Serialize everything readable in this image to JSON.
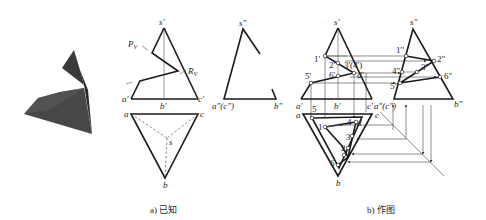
{
  "figure": {
    "iso_view": {
      "description": "shaded 3D sketch of cut triangular pyramid",
      "colors": {
        "dark": "#2b2b2b",
        "mid": "#4a4a4a",
        "light": "#6a6a6a"
      }
    },
    "part_a": {
      "caption": "a) 已知",
      "front_view": {
        "labels": {
          "apex": "s'",
          "a": "a'",
          "b": "b'",
          "c": "c'",
          "plane_p": "P",
          "plane_p_sub": "V",
          "plane_r": "R",
          "plane_r_sub": "V"
        }
      },
      "side_view": {
        "labels": {
          "apex": "s\"",
          "ac": "a\"(c\")",
          "b": "b\""
        }
      },
      "top_view": {
        "labels": {
          "a": "a",
          "b": "b",
          "c": "c",
          "s": "s"
        }
      }
    },
    "part_b": {
      "caption": "b) 作图",
      "front_view": {
        "labels": {
          "apex": "s'",
          "p1": "1'",
          "p2": "2'",
          "p34": "3'(4')",
          "p6": "6'",
          "p5": "5'",
          "d": "d'",
          "a": "a'",
          "b": "b'",
          "c": "c'"
        }
      },
      "side_view": {
        "labels": {
          "apex": "s\"",
          "p1": "1\"",
          "p2": "2\"",
          "p3": "3\"",
          "p4": "4\"",
          "p5": "5\"",
          "p6": "6\"",
          "ac": "a\"(c\")",
          "b": "b\""
        }
      },
      "top_view": {
        "labels": {
          "a": "a",
          "b": "b",
          "c": "c",
          "d": "d",
          "p1": "1",
          "p2": "2",
          "p3": "3",
          "p4": "4",
          "p5": "5",
          "p6": "6"
        }
      }
    }
  }
}
